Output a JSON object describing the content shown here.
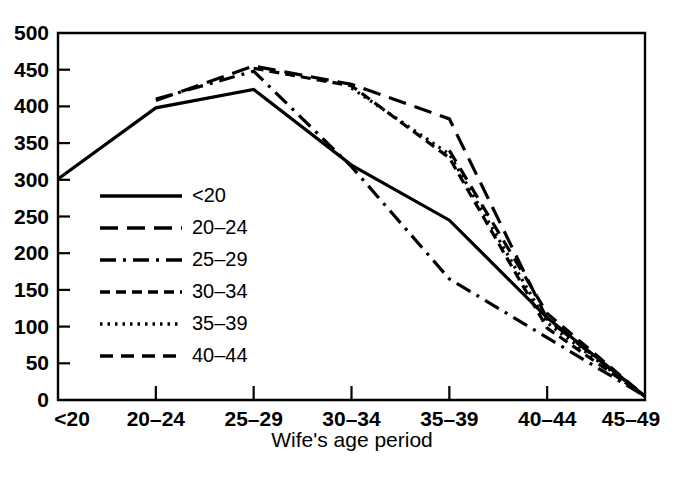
{
  "chart_data": {
    "type": "line",
    "title": "",
    "xlabel": "Wife's age period",
    "ylabel": "",
    "categories": [
      "<20",
      "20-24",
      "25-29",
      "30-34",
      "35-39",
      "40-44",
      "45-49"
    ],
    "ylim": [
      0,
      500
    ],
    "yticks": [
      0,
      50,
      100,
      150,
      200,
      250,
      300,
      350,
      400,
      450,
      500
    ],
    "ytick_labels": [
      "0",
      "50",
      "100",
      "150",
      "200",
      "250",
      "300",
      "350",
      "400",
      "450",
      "500"
    ],
    "grid": false,
    "legend_position": "inside-left",
    "series": [
      {
        "name": "<20",
        "style": "solid",
        "dash": "none",
        "x": [
          "<20",
          "20-24",
          "25-29",
          "30-34",
          "35-39",
          "40-44",
          "45-49"
        ],
        "values": [
          301,
          398,
          423,
          320,
          245,
          112,
          5
        ]
      },
      {
        "name": "20-24",
        "style": "long-dash",
        "dash": "18,9",
        "x": [
          "20-24",
          "25-29",
          "30-34",
          "35-39",
          "40-44",
          "45-49"
        ],
        "values": [
          408,
          455,
          430,
          383,
          110,
          5
        ]
      },
      {
        "name": "25-29",
        "style": "dash-dot",
        "dash": "16,7,3,7",
        "x": [
          "20-24",
          "25-29",
          "30-34",
          "35-39",
          "40-44",
          "45-49"
        ],
        "values": [
          410,
          448,
          318,
          165,
          85,
          5
        ]
      },
      {
        "name": "30-34",
        "style": "short-dash",
        "dash": "10,6",
        "x": [
          "25-29",
          "30-34",
          "35-39",
          "40-44",
          "45-49"
        ],
        "values": [
          452,
          428,
          330,
          98,
          5
        ]
      },
      {
        "name": "35-39",
        "style": "dotted",
        "dash": "2.5,5",
        "x": [
          "30-34",
          "35-39",
          "40-44",
          "45-49"
        ],
        "values": [
          425,
          335,
          105,
          5
        ]
      },
      {
        "name": "40-44",
        "style": "medium-dash",
        "dash": "13,8",
        "x": [
          "35-39",
          "40-44",
          "45-49"
        ],
        "values": [
          340,
          118,
          5
        ]
      }
    ],
    "legend_entries": [
      {
        "label": "<20",
        "dash": "none"
      },
      {
        "label": "20-24",
        "dash": "18,9"
      },
      {
        "label": "25-29",
        "dash": "16,7,3,7"
      },
      {
        "label": "30-34",
        "dash": "10,6"
      },
      {
        "label": "35-39",
        "dash": "2.5,5"
      },
      {
        "label": "40-44",
        "dash": "13,8"
      }
    ]
  },
  "axis": {
    "x_title": "Wife's age period"
  }
}
